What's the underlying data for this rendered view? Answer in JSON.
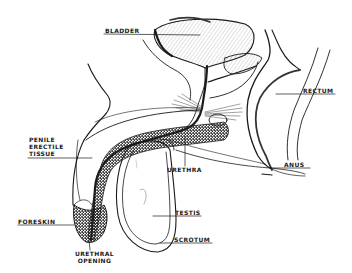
{
  "diagram": {
    "type": "anatomical-line-drawing",
    "colors": {
      "ink": "#1a1a1a",
      "background": "#ffffff",
      "stipple": "#555555"
    },
    "labels": {
      "bladder": "BLADDER",
      "rectum": "RECTUM",
      "penile_erectile_tissue": [
        "PENILE",
        "ERECTILE",
        "TISSUE"
      ],
      "urethra": "URETHRA",
      "anus": "ANUS",
      "foreskin": "FORESKIN",
      "testis": "TESTIS",
      "scrotum": "SCROTUM",
      "urethral_opening": [
        "URETHRAL",
        "OPENING"
      ]
    }
  }
}
